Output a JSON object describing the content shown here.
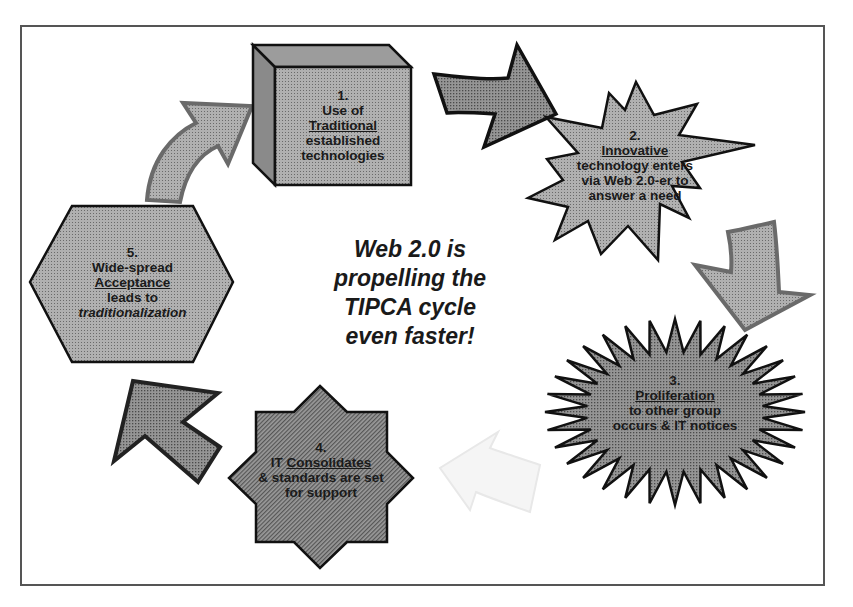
{
  "diagram": {
    "title": "Web 2.0 is propelling the TIPCA cycle even faster!",
    "center_lines": [
      "Web 2.0 is",
      "propelling the",
      "TIPCA cycle",
      "even faster!"
    ],
    "colors": {
      "frame": "#555555",
      "shape_fill": "#a9a9a9",
      "shape_fill_dark": "#8c8c8c",
      "shape_stroke": "#111111",
      "arrow_light": "#b5b5b5",
      "arrow_faded": "#f2f2f2",
      "text": "#1a1a1a"
    },
    "steps": [
      {
        "shape": "3d-box",
        "number": "1.",
        "line1": "Use of",
        "keyword": "Traditional",
        "line3": "established",
        "line4": "technologies"
      },
      {
        "shape": "starburst-16",
        "number": "2.",
        "keyword": "Innovative",
        "line2": "technology enters",
        "line3": "via Web 2.0-er to",
        "line4": "answer a need"
      },
      {
        "shape": "starburst-32",
        "number": "3.",
        "keyword": "Proliferation",
        "line2": "to other group",
        "line3": "occurs & IT notices"
      },
      {
        "shape": "8-point-star",
        "number": "4.",
        "prefix": "IT ",
        "keyword": "Consolidates",
        "line2": "& standards are set",
        "line3": "for support"
      },
      {
        "shape": "hexagon",
        "number": "5.",
        "line1": "Wide-spread",
        "keyword": "Acceptance",
        "line3": "leads to",
        "line4": "traditionalization"
      }
    ],
    "arrows": [
      {
        "from": 1,
        "to": 2,
        "direction": "right",
        "tone": "dark"
      },
      {
        "from": 2,
        "to": 3,
        "direction": "down-right",
        "tone": "light"
      },
      {
        "from": 3,
        "to": 4,
        "direction": "left",
        "tone": "faded"
      },
      {
        "from": 4,
        "to": 5,
        "direction": "up-left",
        "tone": "dark"
      },
      {
        "from": 5,
        "to": 1,
        "direction": "up-right",
        "tone": "light"
      }
    ]
  }
}
